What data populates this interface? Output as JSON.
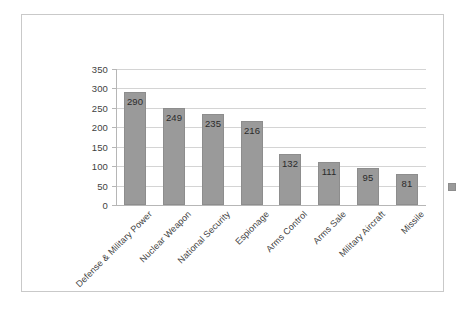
{
  "chart_data": {
    "type": "bar",
    "title": "",
    "subtitle": "",
    "xlabel": "",
    "ylabel": "",
    "categories": [
      "Defense & Military Power",
      "Nuclear Weapon",
      "National Security",
      "Espionage",
      "Arms Control",
      "Arms Sale",
      "Military Aircraft",
      "Missile"
    ],
    "values": [
      290,
      249,
      235,
      216,
      132,
      111,
      95,
      81
    ],
    "data_labels": [
      "290",
      "249",
      "235",
      "216",
      "132",
      "111",
      "95",
      "81"
    ],
    "ylim": [
      0,
      350
    ],
    "ytick_labels": [
      "350",
      "300",
      "250",
      "200",
      "150",
      "100",
      "50",
      "0"
    ],
    "ytick_values": [
      350,
      300,
      250,
      200,
      150,
      100,
      50,
      0
    ],
    "grid": "horizontal",
    "legend_position": "right",
    "legend_entries": [
      ""
    ],
    "series": [
      {
        "name": "",
        "values": [
          290,
          249,
          235,
          216,
          132,
          111,
          95,
          81
        ]
      }
    ]
  },
  "style": {
    "bar_color": "#9a9a9a",
    "bar_border_color": "#8d8d8d",
    "gridline_color": "#d4d4d4",
    "axis_color": "#b6b6b6",
    "frame_border_color": "#c9c9c9",
    "text_color": "#3f3f3f",
    "background": "#ffffff"
  }
}
